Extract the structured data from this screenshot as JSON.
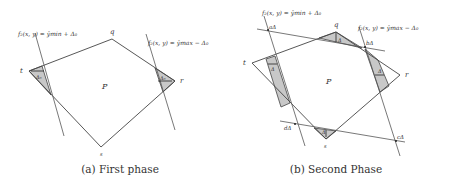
{
  "figure": {
    "panels": [
      {
        "id": "a",
        "caption": "(a) First phase",
        "polygon_label": "P",
        "vertices": {
          "t": "t",
          "q": "q",
          "r": "r",
          "s": "s"
        },
        "line_labels": {
          "min": "f₂(x, y) = ŷmin + Δ₀",
          "max": "f₂(x, y) = ŷmax − Δ₀"
        },
        "region_labels": {
          "left": "Δ₀",
          "right": "Δ₀"
        }
      },
      {
        "id": "b",
        "caption": "(b) Second Phase",
        "polygon_label": "P",
        "vertices": {
          "t": "t",
          "q": "q",
          "r": "r",
          "s": "s"
        },
        "line_labels": {
          "min": "f₂(x, y) = ŷmin + Δ₀",
          "max": "f₂(x, y) = ŷmax − Δ₀"
        },
        "intersection_labels": {
          "a": "aΔ",
          "b": "bΔ",
          "c": "cΔ",
          "d": "dΔ"
        },
        "region_labels": {
          "left": "Δ",
          "top": "Δ",
          "right": "Δ",
          "bottom": "Δ"
        }
      }
    ],
    "colors": {
      "line": "#444444",
      "shade": "#c8c8c8",
      "text": "#333333",
      "background": "#ffffff"
    }
  }
}
